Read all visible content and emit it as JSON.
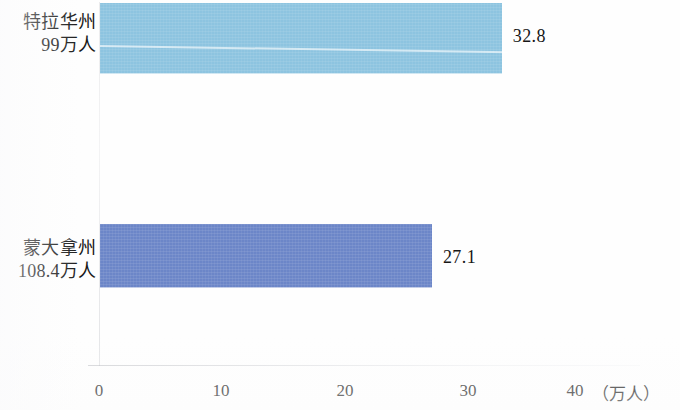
{
  "chart_data": {
    "type": "bar",
    "orientation": "horizontal",
    "title": "",
    "subtitle": "",
    "xlabel": "（万人）",
    "ylabel": "",
    "xlim": [
      0,
      44
    ],
    "grid": false,
    "legend": null,
    "xticks": [
      {
        "value": 0,
        "label": "0"
      },
      {
        "value": 10,
        "label": "10"
      },
      {
        "value": 20,
        "label": "20"
      },
      {
        "value": 30,
        "label": "30"
      },
      {
        "value": 40,
        "label": "40"
      }
    ],
    "categories": [
      "特拉华州\n99万人",
      "蒙大拿州\n108.4万人"
    ],
    "values": [
      32.8,
      27.1
    ],
    "bars": [
      {
        "id": "delaware",
        "label_line1": "特拉华州",
        "label_line2": "99万人",
        "value": 32.8,
        "value_label": "32.8",
        "color": "#8dc4e0"
      },
      {
        "id": "montana",
        "label_line1": "蒙大拿州",
        "label_line2": "108.4万人",
        "value": 27.1,
        "value_label": "27.1",
        "color": "#6c86c8"
      }
    ]
  },
  "axis": {
    "unit_label": "（万人）",
    "tick_0": "0",
    "tick_10": "10",
    "tick_20": "20",
    "tick_30": "30",
    "tick_40": "40"
  },
  "labels": {
    "delaware_line1": "特拉华州",
    "delaware_line2": "99万人",
    "montana_line1": "蒙大拿州",
    "montana_line2": "108.4万人"
  },
  "values": {
    "delaware": "32.8",
    "montana": "27.1"
  },
  "colors": {
    "bar_delaware": "#8dc4e0",
    "bar_montana": "#6c86c8",
    "background": "#ffffff",
    "text": "#171717",
    "axis_line": "#c8cace"
  }
}
